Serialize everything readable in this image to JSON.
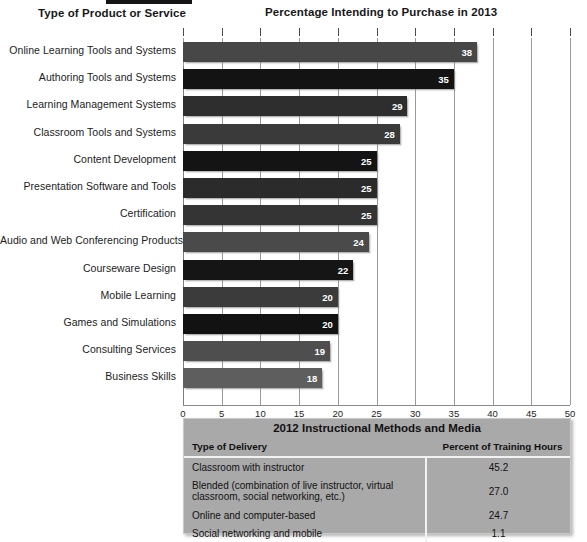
{
  "headers": {
    "left": "Type of Product or Service",
    "right": "Percentage Intending to Purchase in 2013"
  },
  "chart_data": {
    "type": "bar",
    "orientation": "horizontal",
    "title": "Percentage Intending to Purchase in 2013",
    "xlabel": "",
    "ylabel": "Type of Product or Service",
    "xlim": [
      0,
      50
    ],
    "xticks": [
      "0",
      "5",
      "10",
      "15",
      "20",
      "25",
      "30",
      "35",
      "40",
      "45",
      "50"
    ],
    "grid": true,
    "legend": "none",
    "categories": [
      "Online Learning Tools and Systems",
      "Authoring Tools and Systems",
      "Learning Management Systems",
      "Classroom Tools and Systems",
      "Content Development",
      "Presentation Software and Tools",
      "Certification",
      "Audio and Web Conferencing Products",
      "Courseware Design",
      "Mobile Learning",
      "Games and Simulations",
      "Consulting Services",
      "Business Skills"
    ],
    "values": [
      38,
      35,
      29,
      28,
      25,
      25,
      25,
      24,
      22,
      20,
      20,
      19,
      18
    ],
    "bar_colors": [
      "#474747",
      "#131313",
      "#2e2e2e",
      "#3a3a3a",
      "#141414",
      "#2b2b2b",
      "#343434",
      "#4a4a4a",
      "#151515",
      "#3b3b3b",
      "#121212",
      "#4e4e4e",
      "#5e5e5e"
    ]
  },
  "table": {
    "title": "2012 Instructional Methods and Media",
    "columns": [
      "Type of Delivery",
      "Percent of Training Hours"
    ],
    "rows": [
      {
        "delivery": "Classroom with instructor",
        "percent": "45.2"
      },
      {
        "delivery": "Blended (combination of live instructor, virtual classroom, social networking, etc.)",
        "percent": "27.0"
      },
      {
        "delivery": "Online and computer-based",
        "percent": "24.7"
      },
      {
        "delivery": "Social networking and mobile",
        "percent": "1.1"
      }
    ]
  }
}
